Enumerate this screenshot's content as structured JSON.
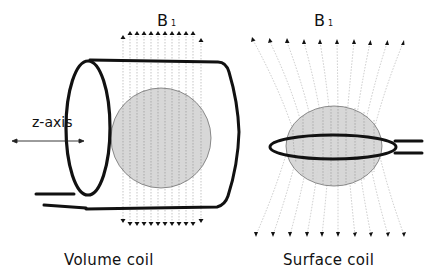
{
  "figure": {
    "volume_coil": {
      "caption": "Volume coil",
      "field_label": "B",
      "field_subscript": "1",
      "axis_label": "z-axis",
      "arrow_count_top": 12,
      "arrow_count_bottom": 12
    },
    "surface_coil": {
      "caption": "Surface coil",
      "field_label": "B",
      "field_subscript": "1",
      "arrow_count_top": 10,
      "arrow_count_bottom": 10
    },
    "colors": {
      "coil_stroke": "#111111",
      "sample_fill": "#d2d2d2",
      "field_line": "#9a9a9a",
      "text": "#111111"
    }
  }
}
